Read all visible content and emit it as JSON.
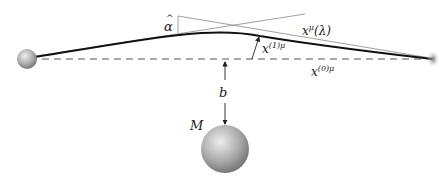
{
  "diagram": {
    "type": "gravitational-lensing",
    "labels": {
      "deflection_angle": "α",
      "deflection_hat": "^",
      "path": "x",
      "path_sup": "μ",
      "path_arg": "(λ)",
      "perturbation": "x",
      "perturbation_sup": "(1)μ",
      "unperturbed": "x",
      "unperturbed_sup": "(0)μ",
      "impact_parameter": "b",
      "mass": "M"
    },
    "colors": {
      "line": "#111111",
      "thin_line": "#777777",
      "dashed": "#555555",
      "sphere_light": "#e6e6e6",
      "sphere_dark": "#7a7a7a"
    }
  }
}
